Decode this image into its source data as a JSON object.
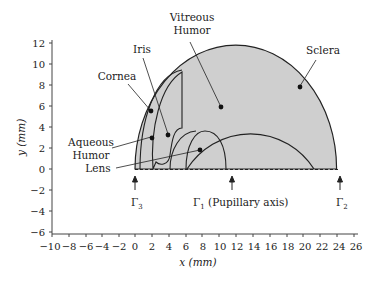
{
  "diagram": {
    "axes": {
      "xlabel": "x (mm)",
      "ylabel": "y (mm)",
      "x_ticks": [
        "−10",
        "−8",
        "−6",
        "−4",
        "−2",
        "0",
        "2",
        "4",
        "6",
        "8",
        "10",
        "12",
        "14",
        "16",
        "18",
        "20",
        "22",
        "24",
        "26"
      ],
      "y_ticks": [
        "12",
        "10",
        "8",
        "6",
        "4",
        "2",
        "0",
        "−2",
        "−4",
        "−6"
      ],
      "xlim": [
        -10,
        26
      ],
      "ylim": [
        -6,
        12
      ]
    },
    "regions": {
      "sclera": "Sclera",
      "vitreous_line1": "Vitreous",
      "vitreous_line2": "Humor",
      "iris": "Iris",
      "cornea": "Cornea",
      "aqueous_line1": "Aqueous",
      "aqueous_line2": "Humor",
      "lens": "Lens"
    },
    "boundaries": {
      "gamma3": "Γ",
      "gamma3_sub": "3",
      "gamma1": "Γ",
      "gamma1_sub": "1",
      "gamma1_desc": " (Pupillary axis)",
      "gamma2": "Γ",
      "gamma2_sub": "2"
    },
    "colors": {
      "fill": "#cfcfcf",
      "stroke": "#222222"
    }
  }
}
